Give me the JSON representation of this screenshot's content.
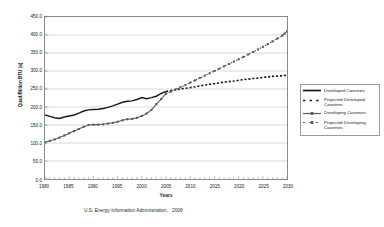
{
  "chart_data": {
    "type": "line",
    "title": "",
    "xlabel": "Years",
    "ylabel": "Quad/Billion BTU (a)",
    "xlim": [
      1980,
      2030
    ],
    "ylim": [
      0,
      450
    ],
    "grid": true,
    "legend_position": "right",
    "y_ticks": [
      "450.0",
      "400.0",
      "350.0",
      "300.0",
      "250.0",
      "200.0",
      "150.0",
      "100.0",
      "50.0",
      "0.0"
    ],
    "y_tick_values": [
      450,
      400,
      350,
      300,
      250,
      200,
      150,
      100,
      50,
      0
    ],
    "x_ticks": [
      "1980",
      "1985",
      "1990",
      "1995",
      "2000",
      "2005",
      "2010",
      "2015",
      "2020",
      "2025",
      "2030"
    ],
    "x_tick_values": [
      1980,
      1985,
      1990,
      1995,
      2000,
      2005,
      2010,
      2015,
      2020,
      2025,
      2030
    ],
    "series": [
      {
        "name": "Developed Countries",
        "style": "solid",
        "color": "#1a1a1a",
        "markers": false,
        "x": [
          1980,
          1981,
          1982,
          1983,
          1984,
          1985,
          1986,
          1987,
          1988,
          1989,
          1990,
          1991,
          1992,
          1993,
          1994,
          1995,
          1996,
          1997,
          1998,
          1999,
          2000,
          2001,
          2002,
          2003,
          2004,
          2005
        ],
        "values": [
          178,
          174,
          170,
          168,
          172,
          175,
          178,
          183,
          189,
          192,
          193,
          194,
          196,
          199,
          203,
          208,
          213,
          216,
          217,
          221,
          226,
          223,
          226,
          230,
          238,
          243
        ]
      },
      {
        "name": "Projected Developed Countries",
        "style": "dotted",
        "color": "#1a1a1a",
        "markers": false,
        "x": [
          2005,
          2007,
          2009,
          2011,
          2013,
          2015,
          2017,
          2019,
          2021,
          2023,
          2025,
          2027,
          2029,
          2030
        ],
        "values": [
          243,
          248,
          252,
          256,
          261,
          265,
          269,
          272,
          276,
          279,
          282,
          285,
          287,
          288
        ]
      },
      {
        "name": "Developing Countries",
        "style": "solid-marker",
        "color": "#5a5a5a",
        "markers": true,
        "x": [
          1980,
          1981,
          1982,
          1983,
          1984,
          1985,
          1986,
          1987,
          1988,
          1989,
          1990,
          1991,
          1992,
          1993,
          1994,
          1995,
          1996,
          1997,
          1998,
          1999,
          2000,
          2001,
          2002,
          2003,
          2004,
          2005
        ],
        "values": [
          102,
          106,
          110,
          115,
          121,
          127,
          133,
          139,
          145,
          150,
          151,
          151,
          152,
          154,
          156,
          159,
          163,
          166,
          167,
          170,
          175,
          182,
          192,
          208,
          222,
          237
        ]
      },
      {
        "name": "Projected Developing Countries",
        "style": "dotted-marker",
        "color": "#5a5a5a",
        "markers": true,
        "x": [
          2005,
          2007,
          2009,
          2011,
          2013,
          2015,
          2017,
          2019,
          2021,
          2023,
          2025,
          2027,
          2029,
          2030
        ],
        "values": [
          237,
          249,
          261,
          274,
          287,
          300,
          313,
          326,
          339,
          353,
          367,
          382,
          398,
          410
        ]
      }
    ]
  },
  "legend": {
    "items": [
      {
        "label": "Developed Countries"
      },
      {
        "label": "Projected Developed Countries"
      },
      {
        "label": "Developing Countries"
      },
      {
        "label": "Projected Developing Countries"
      }
    ]
  },
  "source_note": "U.S. Energy Information Administration,   2008"
}
